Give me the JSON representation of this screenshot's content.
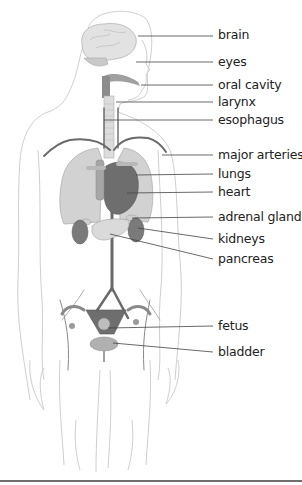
{
  "diagram": {
    "type": "anatomical illustration",
    "labels": [
      {
        "text": "brain",
        "y": 35,
        "target": [
          138,
          36
        ]
      },
      {
        "text": "eyes",
        "y": 62,
        "target": [
          136,
          62
        ]
      },
      {
        "text": "oral cavity",
        "y": 85,
        "target": [
          141,
          85
        ]
      },
      {
        "text": "larynx",
        "y": 102,
        "target": [
          116,
          102
        ]
      },
      {
        "text": "esophagus",
        "y": 120,
        "target": [
          104,
          120
        ]
      },
      {
        "text": "major arteries",
        "y": 155,
        "target": [
          162,
          155
        ]
      },
      {
        "text": "lungs",
        "y": 174,
        "target": [
          136,
          175
        ]
      },
      {
        "text": "heart",
        "y": 192,
        "target": [
          127,
          193
        ]
      },
      {
        "text": "adrenal glands",
        "y": 217,
        "target": [
          132,
          218
        ]
      },
      {
        "text": "kidneys",
        "y": 239,
        "target": [
          138,
          228
        ]
      },
      {
        "text": "pancreas",
        "y": 259,
        "target": [
          110,
          234
        ]
      },
      {
        "text": "fetus",
        "y": 326,
        "target": [
          108,
          328
        ]
      },
      {
        "text": "bladder",
        "y": 352,
        "target": [
          113,
          343
        ]
      }
    ]
  },
  "colors": {
    "outline": "#c8c8c8",
    "organ_light": "#d8d8d8",
    "organ_mid": "#a8a8a8",
    "organ_dark": "#6a6a6a",
    "leader_line": "#444444",
    "text": "#222222"
  }
}
